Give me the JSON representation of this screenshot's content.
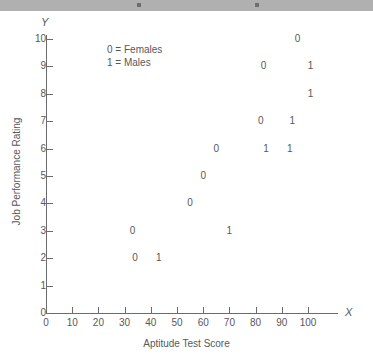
{
  "top_bar": {
    "present": true,
    "color": "#b0b0b0"
  },
  "chart_data": {
    "type": "scatter",
    "title": "",
    "xlabel": "Aptitude Test Score",
    "ylabel": "Job Performance Rating",
    "x_axis_letter": "X",
    "y_axis_letter": "Y",
    "xlim": [
      0,
      110
    ],
    "ylim": [
      0,
      10.6
    ],
    "xticks": [
      0,
      10,
      20,
      30,
      40,
      50,
      60,
      70,
      80,
      90,
      100
    ],
    "xtick_labels": [
      "0",
      "10",
      "20",
      "30",
      "40",
      "50",
      "60",
      "70",
      "80",
      "90",
      "100"
    ],
    "yticks": [
      0,
      1,
      2,
      3,
      4,
      5,
      6,
      7,
      8,
      9,
      10
    ],
    "ytick_labels": [
      "0",
      "1",
      "2",
      "3",
      "4",
      "5",
      "6",
      "7",
      "8",
      "9",
      "10"
    ],
    "grid": false,
    "legend_position": "upper-left-inside",
    "legend": [
      "0 = Females",
      "1 = Males"
    ],
    "marker_color": "#58585a",
    "points": [
      {
        "x": 33,
        "y": 3,
        "label": "0",
        "group": "Females"
      },
      {
        "x": 34,
        "y": 2,
        "label": "0",
        "group": "Females"
      },
      {
        "x": 43,
        "y": 2,
        "label": "1",
        "group": "Males"
      },
      {
        "x": 55,
        "y": 4,
        "label": "0",
        "group": "Females"
      },
      {
        "x": 60,
        "y": 5,
        "label": "0",
        "group": "Females"
      },
      {
        "x": 65,
        "y": 6,
        "label": "0",
        "group": "Females"
      },
      {
        "x": 70,
        "y": 3,
        "label": "1",
        "group": "Males"
      },
      {
        "x": 82,
        "y": 7,
        "label": "0",
        "group": "Females"
      },
      {
        "x": 84,
        "y": 6,
        "label": "1",
        "group": "Males"
      },
      {
        "x": 83,
        "y": 9,
        "label": "0",
        "group": "Females"
      },
      {
        "x": 93,
        "y": 6,
        "label": "1",
        "group": "Males"
      },
      {
        "x": 94,
        "y": 7,
        "label": "1",
        "group": "Males"
      },
      {
        "x": 96,
        "y": 10,
        "label": "0",
        "group": "Females"
      },
      {
        "x": 101,
        "y": 8,
        "label": "1",
        "group": "Males"
      },
      {
        "x": 101,
        "y": 9,
        "label": "1",
        "group": "Males"
      }
    ]
  }
}
